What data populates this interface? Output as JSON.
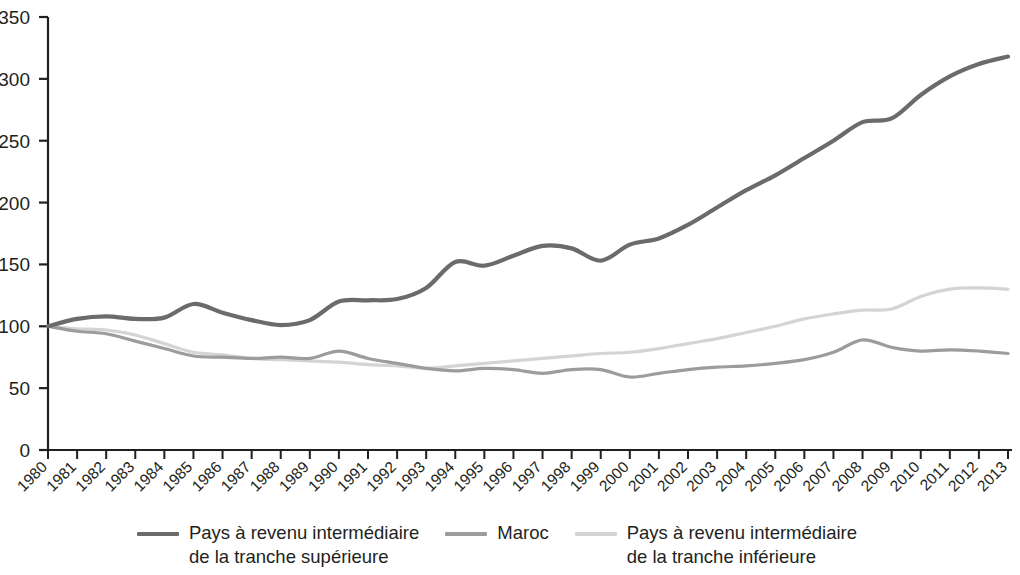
{
  "chart_data": {
    "type": "line",
    "title": "",
    "xlabel": "",
    "ylabel": "",
    "ylim": [
      0,
      350
    ],
    "ytick_step": 50,
    "yticks": [
      "0",
      "50",
      "100",
      "150",
      "200",
      "250",
      "300",
      "350"
    ],
    "grid": false,
    "legend_position": "bottom",
    "x": [
      "1980",
      "1981",
      "1982",
      "1983",
      "1984",
      "1985",
      "1986",
      "1987",
      "1988",
      "1989",
      "1990",
      "1991",
      "1992",
      "1993",
      "1994",
      "1995",
      "1996",
      "1997",
      "1998",
      "1999",
      "2000",
      "2001",
      "2002",
      "2003",
      "2004",
      "2005",
      "2006",
      "2007",
      "2008",
      "2009",
      "2010",
      "2011",
      "2012",
      "2013"
    ],
    "series": [
      {
        "name": "Pays à revenu intermédiaire\nde la tranche supérieure",
        "color": "#6b6b6b",
        "width": 4.2,
        "values": [
          100,
          106,
          108,
          106,
          107,
          118,
          111,
          105,
          101,
          105,
          120,
          121,
          122,
          131,
          152,
          149,
          157,
          165,
          163,
          153,
          166,
          171,
          182,
          196,
          210,
          222,
          236,
          250,
          265,
          268,
          287,
          302,
          312,
          318
        ]
      },
      {
        "name": "Maroc",
        "color": "#9c9c9c",
        "width": 3.2,
        "values": [
          100,
          96,
          94,
          88,
          82,
          76,
          75,
          74,
          75,
          74,
          80,
          74,
          70,
          66,
          64,
          66,
          65,
          62,
          65,
          65,
          59,
          62,
          65,
          67,
          68,
          70,
          73,
          79,
          89,
          83,
          80,
          81,
          80,
          78
        ]
      },
      {
        "name": "Pays à revenu intermédiaire\nde la tranche inférieure",
        "color": "#d4d4d4",
        "width": 3.2,
        "values": [
          100,
          98,
          97,
          93,
          86,
          79,
          77,
          74,
          73,
          72,
          71,
          69,
          68,
          66,
          68,
          70,
          72,
          74,
          76,
          78,
          79,
          82,
          86,
          90,
          95,
          100,
          106,
          110,
          113,
          114,
          124,
          130,
          131,
          130
        ]
      }
    ]
  },
  "axis": {
    "y_labels": [
      "350",
      "300",
      "250",
      "200",
      "150",
      "100",
      "50",
      "0"
    ],
    "x_labels": [
      "1980",
      "1981",
      "1982",
      "1983",
      "1984",
      "1985",
      "1986",
      "1987",
      "1988",
      "1989",
      "1990",
      "1991",
      "1992",
      "1993",
      "1994",
      "1995",
      "1996",
      "1997",
      "1998",
      "1999",
      "2000",
      "2001",
      "2002",
      "2003",
      "2004",
      "2005",
      "2006",
      "2007",
      "2008",
      "2009",
      "2010",
      "2011",
      "2012",
      "2013"
    ],
    "axis_color": "#231f20"
  },
  "legend": {
    "items": [
      {
        "label": "Pays à revenu intermédiaire\nde la tranche supérieure",
        "color": "#6b6b6b"
      },
      {
        "label": "Maroc",
        "color": "#9c9c9c"
      },
      {
        "label": "Pays à revenu intermédiaire\nde la tranche inférieure",
        "color": "#d4d4d4"
      }
    ]
  }
}
